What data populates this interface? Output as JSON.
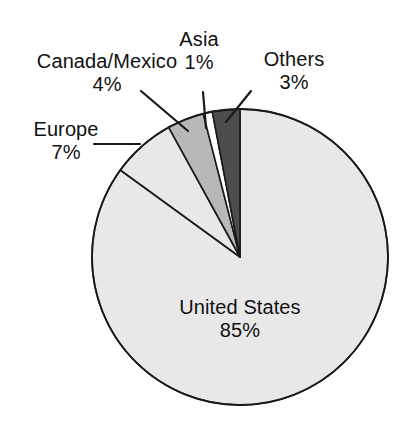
{
  "chart_data": {
    "type": "pie",
    "title": "",
    "subtitle": "",
    "xlabel": "",
    "ylabel": "",
    "legend_position": "none",
    "grid": false,
    "units": "percent",
    "categories": [
      "United States",
      "Europe",
      "Canada/Mexico",
      "Asia",
      "Others"
    ],
    "values": [
      85,
      7,
      4,
      1,
      3
    ],
    "slices": [
      {
        "name": "United States",
        "value": 85,
        "value_text": "85%",
        "color": "#e8e8e8",
        "label_placement": "inside",
        "leader_line": false
      },
      {
        "name": "Europe",
        "value": 7,
        "value_text": "7%",
        "color": "#e8e8e8",
        "label_placement": "outside-left",
        "leader_line": true
      },
      {
        "name": "Canada/Mexico",
        "value": 4,
        "value_text": "4%",
        "color": "#b8b8b8",
        "label_placement": "outside-upper-left",
        "leader_line": true
      },
      {
        "name": "Asia",
        "value": 1,
        "value_text": "1%",
        "color": "#ffffff",
        "label_placement": "outside-top",
        "leader_line": true
      },
      {
        "name": "Others",
        "value": 3,
        "value_text": "3%",
        "color": "#4d4d4d",
        "label_placement": "outside-upper-right",
        "leader_line": true
      }
    ]
  },
  "labels": {
    "united_states": {
      "name": "United States",
      "value": "85%"
    },
    "europe": {
      "name": "Europe",
      "value": "7%"
    },
    "canada_mexico": {
      "name": "Canada/Mexico",
      "value": "4%"
    },
    "asia": {
      "name": "Asia",
      "value": "1%"
    },
    "others": {
      "name": "Others",
      "value": "3%"
    }
  },
  "style": {
    "background": "#ffffff",
    "outline": "#1a1a1a",
    "text_color": "#111111",
    "slice_light": "#e8e8e8",
    "slice_medium": "#b8b8b8",
    "slice_dark": "#4d4d4d",
    "slice_white": "#ffffff"
  }
}
